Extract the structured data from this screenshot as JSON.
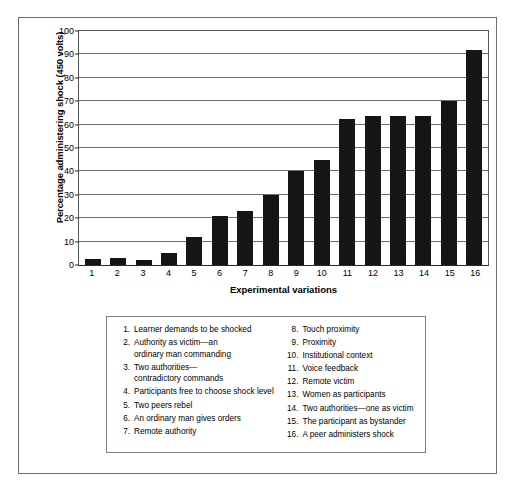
{
  "chart_data": {
    "type": "bar",
    "title": "",
    "xlabel": "Experimental variations",
    "ylabel": "Percentage administering shock (450 volts)",
    "categories": [
      "1",
      "2",
      "3",
      "4",
      "5",
      "6",
      "7",
      "8",
      "9",
      "10",
      "11",
      "12",
      "13",
      "14",
      "15",
      "16"
    ],
    "values": [
      2.5,
      3,
      2,
      5,
      12,
      21,
      23,
      30,
      40,
      45,
      62.5,
      63.5,
      63.5,
      63.5,
      70,
      92
    ],
    "ylim": [
      0,
      100
    ],
    "yticks": [
      0,
      10,
      20,
      30,
      40,
      50,
      60,
      70,
      80,
      90,
      100
    ],
    "ytick_labels": [
      "0",
      "10",
      "20",
      "30",
      "40",
      "50",
      "60",
      "70",
      "80",
      "90",
      "100"
    ],
    "grid": true,
    "legend_position": "below-plot",
    "bar_color": "#151515",
    "series": [
      {
        "name": "Percentage administering shock (450 volts)",
        "values": [
          2.5,
          3,
          2,
          5,
          12,
          21,
          23,
          30,
          40,
          45,
          62.5,
          63.5,
          63.5,
          63.5,
          70,
          92
        ]
      }
    ]
  },
  "legend": {
    "left_column": [
      {
        "num": "1.",
        "text": "Learner demands to be shocked",
        "cont": ""
      },
      {
        "num": "2.",
        "text": "Authority as victim—an",
        "cont": "ordinary man commanding"
      },
      {
        "num": "3.",
        "text": "Two authorities—",
        "cont": "contradictory commands"
      },
      {
        "num": "4.",
        "text": "Participants free to choose shock level",
        "cont": ""
      },
      {
        "num": "5.",
        "text": "Two peers rebel",
        "cont": ""
      },
      {
        "num": "6.",
        "text": "An ordinary man gives orders",
        "cont": ""
      },
      {
        "num": "7.",
        "text": "Remote authority",
        "cont": ""
      }
    ],
    "right_column": [
      {
        "num": "8.",
        "text": "Touch proximity",
        "cont": ""
      },
      {
        "num": "9.",
        "text": "Proximity",
        "cont": ""
      },
      {
        "num": "10.",
        "text": "Institutional context",
        "cont": ""
      },
      {
        "num": "11.",
        "text": "Voice feedback",
        "cont": ""
      },
      {
        "num": "12.",
        "text": "Remote victim",
        "cont": ""
      },
      {
        "num": "13.",
        "text": "Women as participants",
        "cont": ""
      },
      {
        "num": "14.",
        "text": "Two authorities—one as victim",
        "cont": ""
      },
      {
        "num": "15.",
        "text": "The participant as bystander",
        "cont": ""
      },
      {
        "num": "16.",
        "text": "A peer administers shock",
        "cont": ""
      }
    ]
  }
}
